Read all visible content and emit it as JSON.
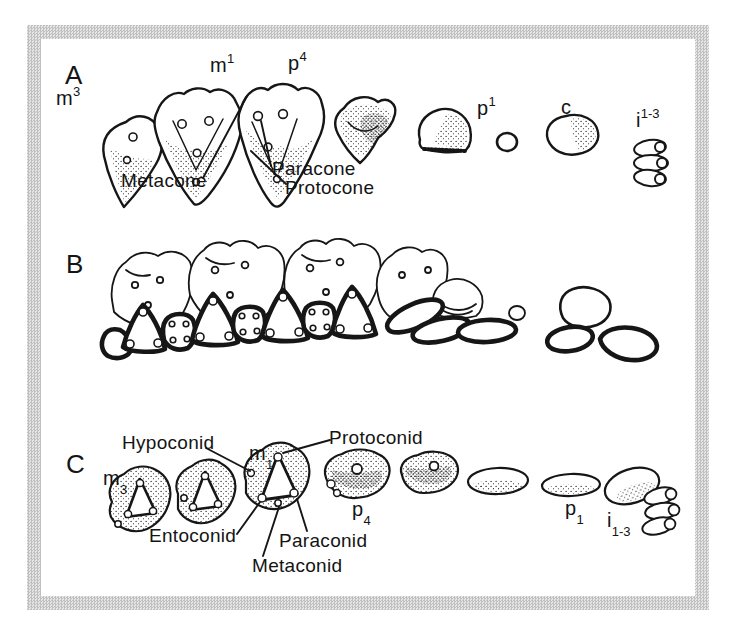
{
  "figure": {
    "frame_color": "#c6c6c6",
    "paper_color": "#ffffff",
    "ink_color": "#161616"
  },
  "panel_a": {
    "letter": "A",
    "teeth": {
      "m3": {
        "base": "m",
        "script": "3"
      },
      "m1": {
        "base": "m",
        "script": "1"
      },
      "p4": {
        "base": "p",
        "script": "4"
      },
      "p1": {
        "base": "p",
        "script": "1"
      },
      "c": {
        "base": "c",
        "script": ""
      },
      "i13": {
        "base": "i",
        "script": "1-3"
      }
    },
    "cusps": {
      "metacone": "Metacone",
      "protocone": "Protocone",
      "paracone": "Paracone"
    }
  },
  "panel_b": {
    "letter": "B"
  },
  "panel_c": {
    "letter": "C",
    "teeth": {
      "m3": {
        "base": "m",
        "script": "3"
      },
      "m1": {
        "base": "m",
        "script": "1"
      },
      "p4": {
        "base": "p",
        "script": "4"
      },
      "p1": {
        "base": "p",
        "script": "1"
      },
      "i13": {
        "base": "i",
        "script": "1-3"
      }
    },
    "cusps": {
      "hypoconid": "Hypoconid",
      "protoconid": "Protoconid",
      "entoconid": "Entoconid",
      "paraconid": "Paraconid",
      "metaconid": "Metaconid"
    }
  }
}
